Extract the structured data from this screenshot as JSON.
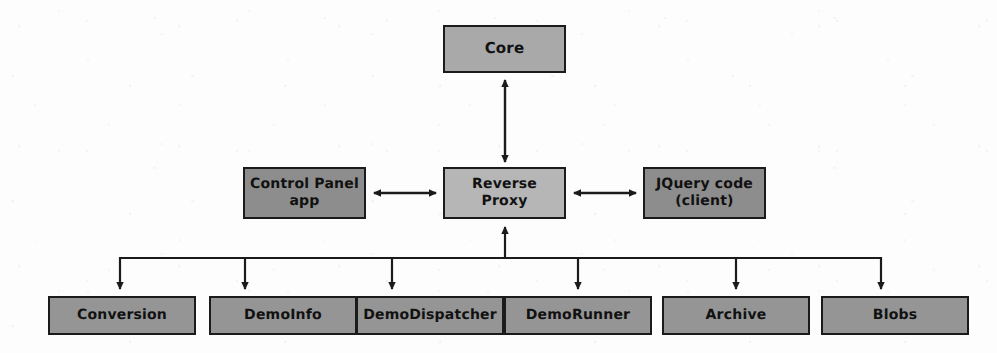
{
  "diagram": {
    "background_color": "#fdfdfd",
    "stroke_color": "#1b1b1b",
    "palette": {
      "core_fill": "#a9a9a9",
      "proxy_fill": "#b6b6b6",
      "peer_fill": "#8d8d8d",
      "service_fill": "#959595"
    },
    "nodes": [
      {
        "id": "core",
        "label": "Core",
        "fill": "#a9a9a9",
        "x": 443,
        "y": 25,
        "w": 123,
        "h": 48,
        "font_size": 15
      },
      {
        "id": "control-panel-app",
        "label": "Control Panel\napp",
        "fill": "#8d8d8d",
        "x": 243,
        "y": 167,
        "w": 123,
        "h": 52,
        "font_size": 14
      },
      {
        "id": "reverse-proxy",
        "label": "Reverse\nProxy",
        "fill": "#b6b6b6",
        "x": 443,
        "y": 167,
        "w": 123,
        "h": 52,
        "font_size": 14
      },
      {
        "id": "jquery-code-client",
        "label": "JQuery code\n(client)",
        "fill": "#8d8d8d",
        "x": 643,
        "y": 167,
        "w": 123,
        "h": 52,
        "font_size": 14
      },
      {
        "id": "conversion",
        "label": "Conversion",
        "fill": "#959595",
        "x": 48,
        "y": 296,
        "w": 148,
        "h": 39,
        "font_size": 14
      },
      {
        "id": "demoinfo",
        "label": "DemoInfo",
        "fill": "#959595",
        "x": 209,
        "y": 296,
        "w": 148,
        "h": 39,
        "font_size": 14
      },
      {
        "id": "demodispatcher",
        "label": "DemoDispatcher",
        "fill": "#959595",
        "x": 356,
        "y": 296,
        "w": 148,
        "h": 39,
        "font_size": 14
      },
      {
        "id": "demorunner",
        "label": "DemoRunner",
        "fill": "#959595",
        "x": 504,
        "y": 296,
        "w": 148,
        "h": 39,
        "font_size": 14
      },
      {
        "id": "archive",
        "label": "Archive",
        "fill": "#959595",
        "x": 662,
        "y": 296,
        "w": 148,
        "h": 39,
        "font_size": 14
      },
      {
        "id": "blobs",
        "label": "Blobs",
        "fill": "#959595",
        "x": 821,
        "y": 296,
        "w": 148,
        "h": 39,
        "font_size": 14
      }
    ],
    "edges": [
      {
        "id": "core-to-reverse-proxy",
        "kind": "bidirectional-vertical",
        "from": "reverse-proxy",
        "to": "core"
      },
      {
        "id": "control-panel-to-reverse-proxy",
        "kind": "bidirectional-horizontal",
        "from": "control-panel-app",
        "to": "reverse-proxy"
      },
      {
        "id": "reverse-proxy-to-jquery",
        "kind": "bidirectional-horizontal",
        "from": "reverse-proxy",
        "to": "jquery-code-client"
      },
      {
        "id": "reverse-proxy-to-service-bus",
        "kind": "bus-riser",
        "from": "service-bus",
        "to": "reverse-proxy"
      },
      {
        "id": "bus-to-conversion",
        "kind": "bus-drop",
        "from": "service-bus",
        "to": "conversion"
      },
      {
        "id": "bus-to-demoinfo",
        "kind": "bus-drop",
        "from": "service-bus",
        "to": "demoinfo"
      },
      {
        "id": "bus-to-demodispatcher",
        "kind": "bus-drop",
        "from": "service-bus",
        "to": "demodispatcher"
      },
      {
        "id": "bus-to-demorunner",
        "kind": "bus-drop",
        "from": "service-bus",
        "to": "demorunner"
      },
      {
        "id": "bus-to-archive",
        "kind": "bus-drop",
        "from": "service-bus",
        "to": "archive"
      },
      {
        "id": "bus-to-blobs",
        "kind": "bus-drop",
        "from": "service-bus",
        "to": "blobs"
      }
    ],
    "bus": {
      "y": 258,
      "x_start": 120,
      "x_end": 881,
      "riser_x": 505,
      "drop_x": [
        120,
        245,
        392,
        578,
        736,
        881
      ]
    }
  }
}
